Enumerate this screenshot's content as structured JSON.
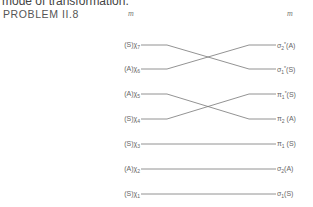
{
  "header": {
    "cut_text": "mode of transformation.",
    "problem_title": "PROBLEM II.8",
    "left_column_label": "m",
    "right_column_label": "m"
  },
  "diagram": {
    "left_labels": [
      {
        "sym": "(S)",
        "var": "χ",
        "sub": "7"
      },
      {
        "sym": "(A)",
        "var": "χ",
        "sub": "6"
      },
      {
        "sym": "(A)",
        "var": "χ",
        "sub": "5"
      },
      {
        "sym": "(S)",
        "var": "χ",
        "sub": "4"
      },
      {
        "sym": "(S)",
        "var": "χ",
        "sub": "3"
      },
      {
        "sym": "(A)",
        "var": "χ",
        "sub": "2"
      },
      {
        "sym": "(S)",
        "var": "χ",
        "sub": "1"
      }
    ],
    "right_labels": [
      {
        "var": "σ",
        "sub": "2",
        "sup": "*",
        "sym": "(A)"
      },
      {
        "var": "σ",
        "sub": "1",
        "sup": "*",
        "sym": "(S)"
      },
      {
        "var": "π",
        "sub": "1",
        "sup": "*",
        "sym": "(S)"
      },
      {
        "var": "π",
        "sub": "2",
        "sup": "",
        "sym": " (A)"
      },
      {
        "var": "π",
        "sub": "1",
        "sup": "",
        "sym": " (S)"
      },
      {
        "var": "σ",
        "sub": "2",
        "sup": "",
        "sym": "(A)"
      },
      {
        "var": "σ",
        "sub": "1",
        "sup": "",
        "sym": "(S)"
      }
    ],
    "correlations": [
      {
        "from": 0,
        "to": 1
      },
      {
        "from": 1,
        "to": 0
      },
      {
        "from": 2,
        "to": 3
      },
      {
        "from": 3,
        "to": 2
      },
      {
        "from": 4,
        "to": 4
      },
      {
        "from": 5,
        "to": 5
      },
      {
        "from": 6,
        "to": 6
      }
    ],
    "line_color": "#777777"
  }
}
